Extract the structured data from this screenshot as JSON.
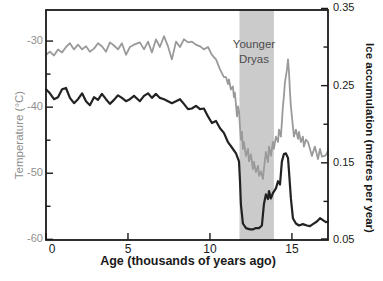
{
  "chart_data": {
    "type": "line",
    "title": "",
    "x_axis": {
      "label": "Age (thousands of years ago)",
      "ticks": [
        {
          "label": "0",
          "value": 0
        },
        {
          "label": "5",
          "value": 5
        },
        {
          "label": "10",
          "value": 10
        },
        {
          "label": "15",
          "value": 15
        }
      ],
      "range": [
        0,
        17.2
      ],
      "grid": false
    },
    "y_left": {
      "label": "Temperature (°C)",
      "ticks": [
        {
          "label": "-30",
          "value": -30
        },
        {
          "label": "-40",
          "value": -40
        },
        {
          "label": "-50",
          "value": -50
        },
        {
          "label": "-60",
          "value": -60
        }
      ],
      "minor_ticks": [
        -35,
        -45,
        -55
      ],
      "range": [
        -60.1,
        -25.3
      ]
    },
    "y_right": {
      "label": "Ice accumulation (metres per year)",
      "ticks": [
        {
          "label": "0.35",
          "value": 0.35
        },
        {
          "label": "0.25",
          "value": 0.25
        },
        {
          "label": "0.15",
          "value": 0.15
        },
        {
          "label": "0.05",
          "value": 0.05
        }
      ],
      "minor_ticks": [
        0.3,
        0.2,
        0.1
      ],
      "range": [
        0.05,
        0.348
      ]
    },
    "annotation": {
      "lines": [
        "Younger",
        "Dryas"
      ],
      "band_x_range": [
        11.8,
        13.9
      ],
      "band_color": "#cbcbcb",
      "text_color": "#4c4c4c"
    },
    "legend": "none",
    "series": [
      {
        "name": "Temperature",
        "axis": "left",
        "color": "#222222",
        "points": [
          [
            0,
            -37.3
          ],
          [
            0.24,
            -37.9
          ],
          [
            0.49,
            -38.8
          ],
          [
            0.73,
            -38.5
          ],
          [
            0.98,
            -37.3
          ],
          [
            1.22,
            -37.1
          ],
          [
            1.46,
            -38.6
          ],
          [
            1.71,
            -39.4
          ],
          [
            1.95,
            -38.8
          ],
          [
            2.2,
            -37.9
          ],
          [
            2.44,
            -39.1
          ],
          [
            2.68,
            -39.7
          ],
          [
            2.93,
            -38.5
          ],
          [
            3.17,
            -38.9
          ],
          [
            3.41,
            -38
          ],
          [
            3.66,
            -38.8
          ],
          [
            3.9,
            -39.5
          ],
          [
            4.15,
            -38.9
          ],
          [
            4.39,
            -38.2
          ],
          [
            4.63,
            -38.6
          ],
          [
            4.88,
            -39.1
          ],
          [
            5.12,
            -38.8
          ],
          [
            5.37,
            -38.3
          ],
          [
            5.73,
            -39.1
          ],
          [
            5.98,
            -38.3
          ],
          [
            6.22,
            -37.9
          ],
          [
            6.46,
            -38.6
          ],
          [
            6.71,
            -38
          ],
          [
            6.95,
            -38.6
          ],
          [
            7.2,
            -38.8
          ],
          [
            7.44,
            -39.1
          ],
          [
            7.68,
            -39.4
          ],
          [
            7.93,
            -39.1
          ],
          [
            8.17,
            -38.8
          ],
          [
            8.41,
            -39.5
          ],
          [
            8.66,
            -40.3
          ],
          [
            8.9,
            -40.2
          ],
          [
            9.15,
            -39.8
          ],
          [
            9.39,
            -40.3
          ],
          [
            9.63,
            -40.2
          ],
          [
            9.88,
            -41.4
          ],
          [
            10.12,
            -42.4
          ],
          [
            10.37,
            -42.1
          ],
          [
            10.61,
            -43.2
          ],
          [
            10.85,
            -43.9
          ],
          [
            11.1,
            -45.3
          ],
          [
            11.34,
            -46.1
          ],
          [
            11.59,
            -47
          ],
          [
            11.77,
            -48.2
          ],
          [
            11.83,
            -51.2
          ],
          [
            11.89,
            -54.7
          ],
          [
            12.01,
            -57.6
          ],
          [
            12.2,
            -58.3
          ],
          [
            12.44,
            -58.5
          ],
          [
            12.62,
            -58.5
          ],
          [
            12.8,
            -58.3
          ],
          [
            12.99,
            -58.3
          ],
          [
            13.17,
            -57.9
          ],
          [
            13.29,
            -54.7
          ],
          [
            13.41,
            -53.2
          ],
          [
            13.54,
            -53.9
          ],
          [
            13.6,
            -52.7
          ],
          [
            13.72,
            -53.8
          ],
          [
            13.84,
            -53
          ],
          [
            14.02,
            -52.3
          ],
          [
            14.15,
            -51.2
          ],
          [
            14.27,
            -51.7
          ],
          [
            14.39,
            -48.2
          ],
          [
            14.51,
            -47.1
          ],
          [
            14.63,
            -47
          ],
          [
            14.76,
            -47.7
          ],
          [
            14.82,
            -49.7
          ],
          [
            14.94,
            -53.8
          ],
          [
            15.06,
            -56.8
          ],
          [
            15.24,
            -57.6
          ],
          [
            15.43,
            -57.9
          ],
          [
            15.67,
            -57.7
          ],
          [
            15.91,
            -57.9
          ],
          [
            16.1,
            -58
          ],
          [
            16.28,
            -57.7
          ],
          [
            16.52,
            -57.3
          ],
          [
            16.71,
            -56.8
          ],
          [
            16.89,
            -57.1
          ],
          [
            17.07,
            -57.4
          ],
          [
            17.2,
            -57.3
          ]
        ]
      },
      {
        "name": "Ice accumulation",
        "axis": "right",
        "color": "#9a9a9a",
        "points": [
          [
            0,
            0.29
          ],
          [
            0.24,
            0.294
          ],
          [
            0.49,
            0.289
          ],
          [
            0.73,
            0.297
          ],
          [
            0.98,
            0.293
          ],
          [
            1.22,
            0.3
          ],
          [
            1.46,
            0.305
          ],
          [
            1.71,
            0.297
          ],
          [
            1.95,
            0.303
          ],
          [
            2.2,
            0.297
          ],
          [
            2.44,
            0.301
          ],
          [
            2.68,
            0.294
          ],
          [
            2.93,
            0.298
          ],
          [
            3.17,
            0.305
          ],
          [
            3.41,
            0.301
          ],
          [
            3.66,
            0.294
          ],
          [
            3.9,
            0.306
          ],
          [
            4.15,
            0.302
          ],
          [
            4.39,
            0.297
          ],
          [
            4.63,
            0.305
          ],
          [
            4.88,
            0.29
          ],
          [
            5.12,
            0.3
          ],
          [
            5.37,
            0.303
          ],
          [
            5.73,
            0.306
          ],
          [
            5.98,
            0.297
          ],
          [
            6.22,
            0.307
          ],
          [
            6.46,
            0.293
          ],
          [
            6.71,
            0.31
          ],
          [
            6.95,
            0.3
          ],
          [
            7.2,
            0.314
          ],
          [
            7.44,
            0.301
          ],
          [
            7.68,
            0.284
          ],
          [
            7.93,
            0.307
          ],
          [
            8.17,
            0.3
          ],
          [
            8.41,
            0.31
          ],
          [
            8.66,
            0.306
          ],
          [
            8.9,
            0.307
          ],
          [
            9.15,
            0.303
          ],
          [
            9.39,
            0.301
          ],
          [
            9.63,
            0.297
          ],
          [
            9.88,
            0.3
          ],
          [
            10.12,
            0.29
          ],
          [
            10.37,
            0.284
          ],
          [
            10.61,
            0.271
          ],
          [
            10.85,
            0.261
          ],
          [
            10.98,
            0.261
          ],
          [
            11.1,
            0.252
          ],
          [
            11.16,
            0.258
          ],
          [
            11.28,
            0.245
          ],
          [
            11.4,
            0.249
          ],
          [
            11.46,
            0.235
          ],
          [
            11.52,
            0.241
          ],
          [
            11.65,
            0.21
          ],
          [
            11.71,
            0.223
          ],
          [
            11.77,
            0.217
          ],
          [
            11.83,
            0.197
          ],
          [
            11.89,
            0.18
          ],
          [
            11.95,
            0.19
          ],
          [
            12.01,
            0.168
          ],
          [
            12.07,
            0.177
          ],
          [
            12.2,
            0.159
          ],
          [
            12.32,
            0.168
          ],
          [
            12.38,
            0.152
          ],
          [
            12.5,
            0.161
          ],
          [
            12.62,
            0.142
          ],
          [
            12.68,
            0.151
          ],
          [
            12.8,
            0.138
          ],
          [
            12.93,
            0.146
          ],
          [
            12.99,
            0.133
          ],
          [
            13.11,
            0.139
          ],
          [
            13.23,
            0.129
          ],
          [
            13.29,
            0.142
          ],
          [
            13.41,
            0.164
          ],
          [
            13.54,
            0.151
          ],
          [
            13.6,
            0.171
          ],
          [
            13.72,
            0.159
          ],
          [
            13.84,
            0.177
          ],
          [
            13.9,
            0.168
          ],
          [
            14.02,
            0.184
          ],
          [
            14.15,
            0.177
          ],
          [
            14.21,
            0.193
          ],
          [
            14.33,
            0.184
          ],
          [
            14.39,
            0.203
          ],
          [
            14.45,
            0.223
          ],
          [
            14.51,
            0.236
          ],
          [
            14.57,
            0.254
          ],
          [
            14.7,
            0.271
          ],
          [
            14.76,
            0.284
          ],
          [
            14.82,
            0.267
          ],
          [
            14.88,
            0.241
          ],
          [
            14.94,
            0.223
          ],
          [
            15.06,
            0.197
          ],
          [
            15.12,
            0.184
          ],
          [
            15.24,
            0.193
          ],
          [
            15.37,
            0.181
          ],
          [
            15.43,
            0.19
          ],
          [
            15.55,
            0.177
          ],
          [
            15.67,
            0.184
          ],
          [
            15.73,
            0.171
          ],
          [
            15.85,
            0.18
          ],
          [
            15.98,
            0.177
          ],
          [
            16.1,
            0.168
          ],
          [
            16.22,
            0.159
          ],
          [
            16.4,
            0.171
          ],
          [
            16.59,
            0.155
          ],
          [
            16.71,
            0.168
          ],
          [
            16.83,
            0.158
          ],
          [
            17.01,
            0.159
          ],
          [
            17.13,
            0.162
          ],
          [
            17.2,
            0.166
          ]
        ]
      }
    ],
    "axis_color": "#1a1a1a"
  }
}
